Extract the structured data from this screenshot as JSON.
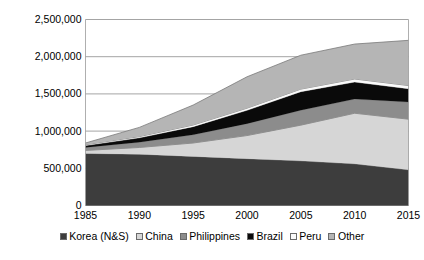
{
  "chart_data": {
    "type": "area",
    "stacked": true,
    "title": "",
    "subtitle": "",
    "xlabel": "",
    "ylabel": "",
    "grid": true,
    "legend_position": "bottom",
    "x": [
      1985,
      1990,
      1995,
      2000,
      2005,
      2010,
      2015
    ],
    "xtick_labels": [
      "1985",
      "1990",
      "1995",
      "2000",
      "2005",
      "2010",
      "2015"
    ],
    "ytick_labels": [
      "0",
      "500,000",
      "1,000,000",
      "1,500,000",
      "2,000,000",
      "2,500,000"
    ],
    "ytick_values": [
      0,
      500000,
      1000000,
      1500000,
      2000000,
      2500000
    ],
    "ylim": [
      0,
      2500000
    ],
    "xlim": [
      1985,
      2015
    ],
    "series": [
      {
        "name": "Korea (N&S)",
        "color": "#3d3d3d",
        "values": [
          700000,
          690000,
          660000,
          630000,
          600000,
          560000,
          480000
        ]
      },
      {
        "name": "China",
        "color": "#d6d6d6",
        "values": [
          40000,
          90000,
          180000,
          310000,
          480000,
          680000,
          680000
        ]
      },
      {
        "name": "Philippines",
        "color": "#8c8c8c",
        "values": [
          40000,
          70000,
          110000,
          160000,
          200000,
          190000,
          230000
        ]
      },
      {
        "name": "Brazil",
        "color": "#0a0a0a",
        "values": [
          25000,
          60000,
          110000,
          180000,
          250000,
          230000,
          180000
        ]
      },
      {
        "name": "Peru",
        "color": "#fafafa",
        "values": [
          12000,
          16000,
          22000,
          28000,
          34000,
          40000,
          42000
        ]
      },
      {
        "name": "Other",
        "color": "#b5b5b5",
        "values": [
          23000,
          124000,
          268000,
          422000,
          456000,
          470000,
          608000
        ]
      }
    ],
    "totals": [
      840000,
      1050000,
      1350000,
      1730000,
      2020000,
      2170000,
      2220000
    ]
  },
  "legend": {
    "items": [
      {
        "label": "Korea (N&S)",
        "color": "#3d3d3d"
      },
      {
        "label": "China",
        "color": "#d6d6d6"
      },
      {
        "label": "Philippines",
        "color": "#8c8c8c"
      },
      {
        "label": "Brazil",
        "color": "#0a0a0a"
      },
      {
        "label": "Peru",
        "color": "#fafafa"
      },
      {
        "label": "Other",
        "color": "#b5b5b5"
      }
    ]
  },
  "axes": {
    "gridline_color": "#9a9a9a",
    "series_outline_color": "#7a7a7a"
  }
}
